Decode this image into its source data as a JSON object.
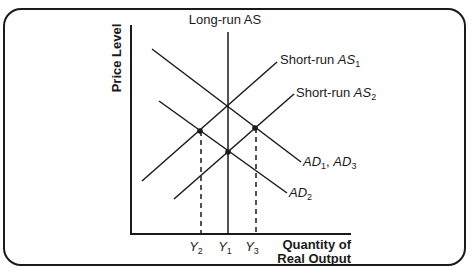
{
  "diagram": {
    "y_axis_label": "Price Level",
    "x_axis_label_line1": "Quantity of",
    "x_axis_label_line2": "Real Output",
    "lras_label": "Long-run AS",
    "sras1_label_prefix": "Short-run ",
    "sras1_label_main": "AS",
    "sras1_label_sub": "1",
    "sras2_label_prefix": "Short-run ",
    "sras2_label_main": "AS",
    "sras2_label_sub": "2",
    "ad1_label_main": "AD",
    "ad1_label_sub": "1",
    "ad1_label_sep": ", ",
    "ad3_label_main": "AD",
    "ad3_label_sub": "3",
    "ad2_label_main": "AD",
    "ad2_label_sub": "2",
    "x_ticks": [
      {
        "main": "Y",
        "sub": "2"
      },
      {
        "main": "Y",
        "sub": "1"
      },
      {
        "main": "Y",
        "sub": "3"
      }
    ],
    "colors": {
      "line": "#1a1a1a",
      "background": "#ffffff"
    }
  }
}
